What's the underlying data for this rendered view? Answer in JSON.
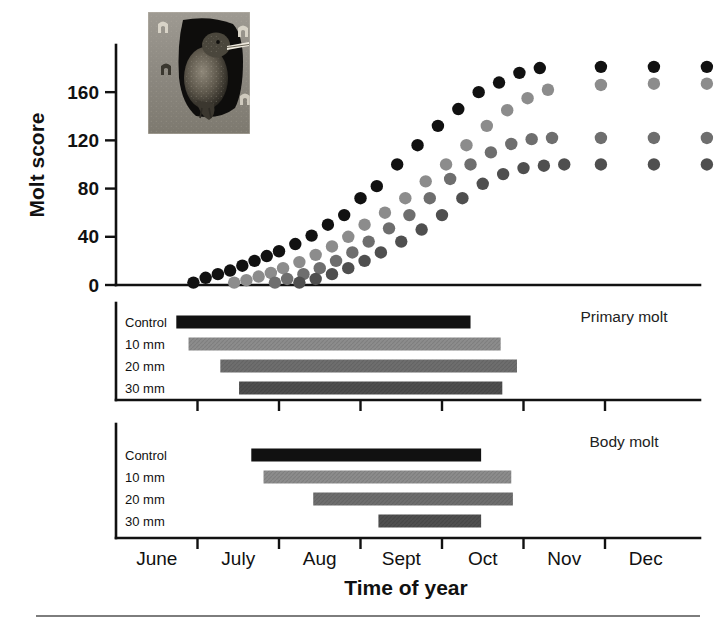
{
  "figure": {
    "inset_photo": {
      "alt_name": "starling-at-nestbox-photo",
      "description": "European starling perched at nest box entrance hole",
      "x": 148,
      "y": 12,
      "width": 102,
      "height": 122
    },
    "bottom_rule_color": "#7d7d7d"
  },
  "colors": {
    "control": "#111111",
    "dose_10mm": "#8c8c8c",
    "dose_20mm": "#6e6e6e",
    "dose_30mm": "#4f4f4f",
    "axis": "#111111",
    "background": "#ffffff"
  },
  "scatter": {
    "ylabel": "Molt score",
    "xlabel": "Time of year",
    "y_ticks": [
      "0",
      "40",
      "80",
      "120",
      "160"
    ],
    "y_tick_values": [
      0,
      40,
      80,
      120,
      160
    ],
    "ylim": [
      0,
      190
    ],
    "x_ticks": [
      "June",
      "July",
      "Aug",
      "Sept",
      "Oct",
      "Nov",
      "Dec"
    ]
  },
  "chart_data": [
    {
      "type": "scatter",
      "title": "Molt score through time of year",
      "xlabel": "Time of year",
      "ylabel": "Molt score",
      "ylim": [
        0,
        190
      ],
      "grid": false,
      "legend": "none",
      "x_tick_labels": [
        "June",
        "July",
        "Aug",
        "Sept",
        "Oct",
        "Nov",
        "Dec"
      ],
      "x_units": "month index (0 = start of June)",
      "series": [
        {
          "name": "Control",
          "color": "#111111",
          "x": [
            0.95,
            1.1,
            1.25,
            1.4,
            1.55,
            1.7,
            1.85,
            2.0,
            2.2,
            2.4,
            2.6,
            2.8,
            3.0,
            3.2,
            3.45,
            3.7,
            3.95,
            4.2,
            4.45,
            4.7,
            4.95,
            5.2,
            5.95,
            6.6,
            7.25
          ],
          "y": [
            2,
            6,
            9,
            12,
            16,
            20,
            24,
            28,
            34,
            41,
            50,
            58,
            72,
            82,
            100,
            116,
            132,
            146,
            160,
            168,
            176,
            180,
            181,
            181,
            181,
            181
          ]
        },
        {
          "name": "10 mm",
          "color": "#8c8c8c",
          "x": [
            1.45,
            1.6,
            1.75,
            1.9,
            2.05,
            2.25,
            2.45,
            2.65,
            2.85,
            3.05,
            3.3,
            3.55,
            3.8,
            4.05,
            4.3,
            4.55,
            4.8,
            5.05,
            5.3,
            5.95,
            6.6,
            7.25
          ],
          "y": [
            2,
            4,
            7,
            10,
            14,
            19,
            25,
            32,
            40,
            50,
            60,
            72,
            86,
            100,
            116,
            132,
            145,
            155,
            162,
            166,
            167,
            167,
            167
          ]
        },
        {
          "name": "20 mm",
          "color": "#6e6e6e",
          "x": [
            1.95,
            2.1,
            2.3,
            2.5,
            2.7,
            2.9,
            3.1,
            3.35,
            3.6,
            3.85,
            4.1,
            4.35,
            4.6,
            4.85,
            5.1,
            5.35,
            5.95,
            6.6,
            7.25
          ],
          "y": [
            2,
            5,
            9,
            14,
            20,
            27,
            36,
            47,
            58,
            72,
            88,
            100,
            110,
            117,
            121,
            122,
            122,
            122,
            122
          ]
        },
        {
          "name": "30 mm",
          "color": "#4f4f4f",
          "x": [
            2.25,
            2.45,
            2.65,
            2.85,
            3.05,
            3.25,
            3.5,
            3.75,
            4.0,
            4.25,
            4.5,
            4.75,
            5.0,
            5.25,
            5.5,
            5.95,
            6.6,
            7.25
          ],
          "y": [
            2,
            5,
            9,
            14,
            20,
            27,
            36,
            46,
            58,
            72,
            84,
            92,
            97,
            99,
            100,
            100,
            100,
            100
          ]
        }
      ]
    },
    {
      "type": "bar",
      "orientation": "horizontal-span",
      "title": "Primary molt",
      "xlabel": "Time of year",
      "x_units": "month index (0 = start of June)",
      "categories": [
        "Control",
        "10 mm",
        "20 mm",
        "30 mm"
      ],
      "spans": [
        {
          "name": "Control",
          "start": 0.74,
          "end": 4.35,
          "color": "#111111"
        },
        {
          "name": "10 mm",
          "start": 0.89,
          "end": 4.72,
          "color": "#8c8c8c"
        },
        {
          "name": "20 mm",
          "start": 1.28,
          "end": 4.92,
          "color": "#6e6e6e"
        },
        {
          "name": "30 mm",
          "start": 1.51,
          "end": 4.74,
          "color": "#4f4f4f"
        }
      ]
    },
    {
      "type": "bar",
      "orientation": "horizontal-span",
      "title": "Body molt",
      "xlabel": "Time of year",
      "x_units": "month index (0 = start of June)",
      "categories": [
        "Control",
        "10 mm",
        "20 mm",
        "30 mm"
      ],
      "spans": [
        {
          "name": "Control",
          "start": 1.66,
          "end": 4.48,
          "color": "#111111"
        },
        {
          "name": "10 mm",
          "start": 1.81,
          "end": 4.85,
          "color": "#8c8c8c"
        },
        {
          "name": "20 mm",
          "start": 2.42,
          "end": 4.87,
          "color": "#6e6e6e"
        },
        {
          "name": "30 mm",
          "start": 3.22,
          "end": 4.48,
          "color": "#4f4f4f"
        }
      ]
    }
  ],
  "panels": {
    "primary": {
      "title": "Primary molt",
      "rows": [
        "Control",
        "10 mm",
        "20 mm",
        "30 mm"
      ]
    },
    "body": {
      "title": "Body molt",
      "rows": [
        "Control",
        "10 mm",
        "20 mm",
        "30 mm"
      ]
    }
  }
}
